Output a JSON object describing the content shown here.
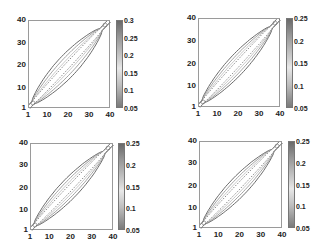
{
  "chart_data": [
    {
      "type": "contour",
      "title": "",
      "xlabel": "",
      "ylabel": "",
      "x_ticks": [
        "1",
        "10",
        "20",
        "30",
        "40"
      ],
      "y_ticks": [
        "40",
        "30",
        "20",
        "10",
        "1"
      ],
      "xlim": [
        1,
        40
      ],
      "ylim": [
        1,
        40
      ],
      "colorbar_ticks": [
        "0.3",
        "0.25",
        "0.2",
        "0.15",
        "0.1",
        "0.05"
      ],
      "colorbar_range": [
        0.05,
        0.3
      ],
      "description": "Diagonal band of contours along x=y, widening near center"
    },
    {
      "type": "contour",
      "title": "",
      "xlabel": "",
      "ylabel": "",
      "x_ticks": [
        "1",
        "10",
        "20",
        "30",
        "40"
      ],
      "y_ticks": [
        "40",
        "30",
        "20",
        "10",
        "1"
      ],
      "xlim": [
        1,
        40
      ],
      "ylim": [
        1,
        40
      ],
      "colorbar_ticks": [
        "0.25",
        "0.2",
        "0.15",
        "0.1",
        "0.05"
      ],
      "colorbar_range": [
        0.05,
        0.25
      ],
      "description": "Diagonal band of contours along x=y"
    },
    {
      "type": "contour",
      "title": "",
      "xlabel": "",
      "ylabel": "",
      "x_ticks": [
        "1",
        "10",
        "20",
        "30",
        "40"
      ],
      "y_ticks": [
        "40",
        "30",
        "20",
        "10",
        "1"
      ],
      "xlim": [
        1,
        40
      ],
      "ylim": [
        1,
        40
      ],
      "colorbar_ticks": [
        "0.25",
        "0.2",
        "0.15",
        "0.1",
        "0.05"
      ],
      "colorbar_range": [
        0.05,
        0.25
      ],
      "description": "Diagonal band of contours along x=y"
    },
    {
      "type": "contour",
      "title": "",
      "xlabel": "",
      "ylabel": "",
      "x_ticks": [
        "1",
        "10",
        "20",
        "30",
        "40"
      ],
      "y_ticks": [
        "40",
        "30",
        "20",
        "10",
        "1"
      ],
      "xlim": [
        1,
        40
      ],
      "ylim": [
        1,
        40
      ],
      "colorbar_ticks": [
        "0.25",
        "0.2",
        "0.15",
        "0.1",
        "0.05"
      ],
      "colorbar_range": [
        0.05,
        0.25
      ],
      "description": "Diagonal band of contours along x=y"
    }
  ]
}
